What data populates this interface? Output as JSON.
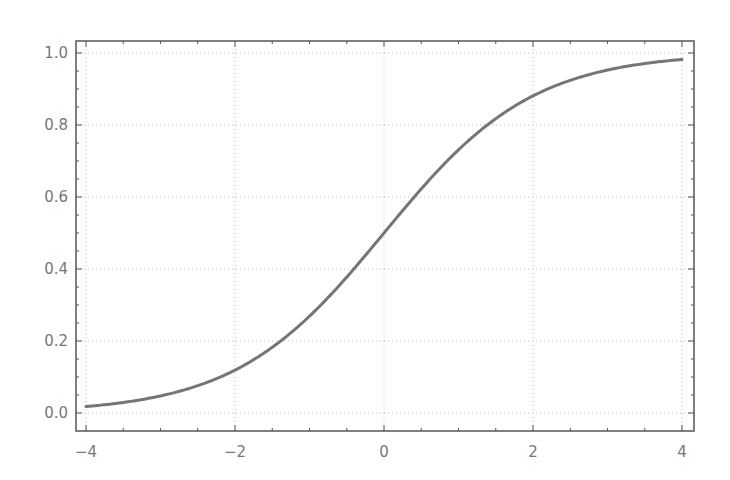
{
  "chart_data": {
    "type": "line",
    "title": "",
    "xlabel": "",
    "ylabel": "",
    "xlim": [
      -4.15,
      4.15
    ],
    "ylim": [
      -0.05,
      1.03
    ],
    "grid": true,
    "legend": null,
    "x_ticks": [
      -4,
      -2,
      0,
      2,
      4
    ],
    "x_tick_labels": [
      "−4",
      "−2",
      "0",
      "2",
      "4"
    ],
    "y_ticks": [
      0.0,
      0.2,
      0.4,
      0.6,
      0.8,
      1.0
    ],
    "y_tick_labels": [
      "0.0",
      "0.2",
      "0.4",
      "0.6",
      "0.8",
      "1.0"
    ],
    "series": [
      {
        "name": "logistic sigmoid",
        "color": "#666666",
        "x": [
          -4,
          -3.5,
          -3,
          -2.5,
          -2,
          -1.5,
          -1,
          -0.5,
          0,
          0.5,
          1,
          1.5,
          2,
          2.5,
          3,
          3.5,
          4
        ],
        "y": [
          0.018,
          0.029,
          0.047,
          0.076,
          0.119,
          0.182,
          0.269,
          0.378,
          0.5,
          0.622,
          0.731,
          0.818,
          0.881,
          0.924,
          0.953,
          0.971,
          0.982
        ]
      }
    ]
  },
  "colors": {
    "frame": "#555555",
    "grid": "#bbbbbb",
    "line": "#666666",
    "text": "#777777"
  }
}
